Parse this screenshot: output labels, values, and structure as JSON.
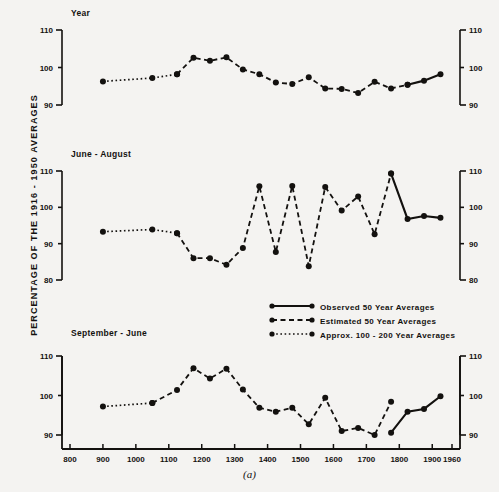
{
  "figure": {
    "caption": "(a)",
    "ylabel": "PERCENTAGE OF THE 1916 - 1950 AVERAGES",
    "colors": {
      "ink": "#13110f",
      "paper": "#f4f3f1"
    }
  },
  "legend": {
    "position": "center-right",
    "entries": [
      {
        "label": "Observed  50 Year  Averages",
        "style": "solid"
      },
      {
        "label": "Estimated  50 Year  Averages",
        "style": "dashed"
      },
      {
        "label": "Approx. 100 - 200  Year  Averages",
        "style": "dotted"
      }
    ]
  },
  "axis": {
    "xlabels": [
      "800",
      "900",
      "1000",
      "1100",
      "1200",
      "1300",
      "1400",
      "1500",
      "1600",
      "1700",
      "1800",
      "1900",
      "1960"
    ],
    "xticks": [
      800,
      900,
      1000,
      1100,
      1200,
      1300,
      1400,
      1500,
      1600,
      1700,
      1800,
      1900,
      1960
    ],
    "xlim": [
      800,
      1960
    ],
    "panels_ylabels_top": [
      "110",
      "100",
      "90"
    ],
    "panels_ylabels_mid": [
      "110",
      "100",
      "90",
      "80"
    ],
    "panels_ylabels_bot": [
      "110",
      "100",
      "90"
    ]
  },
  "chart_data": [
    {
      "type": "line",
      "title": "Year",
      "xlabel": "",
      "ylabel": "PERCENTAGE OF THE 1916 - 1950 AVERAGES",
      "xlim": [
        800,
        1960
      ],
      "ylim": [
        86,
        112
      ],
      "yticks": [
        110,
        100,
        90
      ],
      "grid": false,
      "legend_position": "center-right",
      "series": [
        {
          "name": "Approx. 100-200 Year Averages",
          "style": "dotted",
          "x": [
            900,
            1050,
            1125
          ],
          "y": [
            96.3,
            97.2,
            98.2
          ]
        },
        {
          "name": "Estimated 50 Year Averages",
          "style": "dashed",
          "x": [
            1125,
            1175,
            1225,
            1275,
            1325,
            1375,
            1425,
            1475,
            1525,
            1575,
            1625,
            1675,
            1725,
            1775,
            1825
          ],
          "y": [
            98.2,
            102.6,
            101.8,
            102.7,
            99.5,
            98.2,
            96.0,
            95.6,
            97.4,
            94.4,
            94.3,
            93.2,
            96.2,
            94.4,
            95.4
          ]
        },
        {
          "name": "Observed 50 Year Averages",
          "style": "solid",
          "x": [
            1825,
            1875,
            1925
          ],
          "y": [
            95.4,
            96.5,
            98.2
          ]
        }
      ]
    },
    {
      "type": "line",
      "title": "June - August",
      "xlabel": "",
      "ylabel": "PERCENTAGE OF THE 1916 - 1950 AVERAGES",
      "xlim": [
        800,
        1960
      ],
      "ylim": [
        76,
        112
      ],
      "yticks": [
        110,
        100,
        90,
        80
      ],
      "grid": false,
      "legend_position": "center-right",
      "series": [
        {
          "name": "Approx. 100-200 Year Averages",
          "style": "dotted",
          "x": [
            900,
            1050,
            1125
          ],
          "y": [
            93.3,
            93.9,
            92.9
          ]
        },
        {
          "name": "Estimated 50 Year Averages",
          "style": "dashed",
          "x": [
            1125,
            1175,
            1225,
            1275,
            1325,
            1375,
            1425,
            1475,
            1525,
            1575,
            1625,
            1675,
            1725,
            1775
          ],
          "y": [
            92.9,
            86.0,
            86.0,
            84.2,
            88.8,
            105.8,
            87.7,
            105.9,
            83.8,
            105.6,
            99.1,
            103.0,
            92.6,
            109.3
          ]
        },
        {
          "name": "Observed 50 Year Averages",
          "style": "solid",
          "x": [
            1775,
            1825,
            1875,
            1925
          ],
          "y": [
            109.3,
            96.8,
            97.6,
            97.1
          ]
        }
      ]
    },
    {
      "type": "line",
      "title": "September - June",
      "xlabel": "",
      "ylabel": "PERCENTAGE OF THE 1916 - 1950 AVERAGES",
      "xlim": [
        800,
        1960
      ],
      "ylim": [
        84,
        112
      ],
      "yticks": [
        110,
        100,
        90
      ],
      "grid": false,
      "legend_position": "center-right",
      "series": [
        {
          "name": "Approx. 100-200 Year Averages",
          "style": "dotted",
          "x": [
            900,
            1050
          ],
          "y": [
            97.2,
            98.1
          ]
        },
        {
          "name": "Estimated 50 Year Averages",
          "style": "dashed",
          "x": [
            1050,
            1125,
            1175,
            1225,
            1275,
            1325,
            1375,
            1425,
            1475,
            1525,
            1575,
            1625,
            1675,
            1725,
            1775
          ],
          "y": [
            98.1,
            101.4,
            106.9,
            104.3,
            106.8,
            101.5,
            96.9,
            95.9,
            96.9,
            92.7,
            99.4,
            91.0,
            91.8,
            90.0,
            98.4
          ]
        },
        {
          "name": "Observed 50 Year Averages",
          "style": "solid",
          "x": [
            1775,
            1825,
            1875,
            1925
          ],
          "y": [
            90.6,
            95.9,
            96.6,
            99.8
          ]
        }
      ]
    }
  ]
}
